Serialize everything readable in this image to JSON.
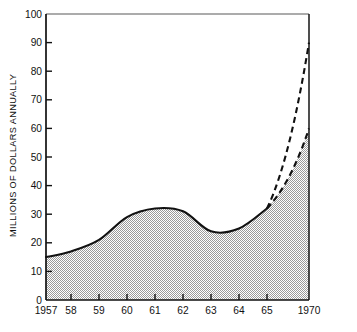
{
  "chart_data": {
    "type": "area",
    "title": "",
    "xlabel": "",
    "ylabel": "MILLIONS OF DOLLARS ANNUALLY",
    "ylim": [
      0,
      100
    ],
    "ytick_values": [
      0,
      10,
      20,
      30,
      40,
      50,
      60,
      70,
      80,
      90,
      100
    ],
    "ytick_labels": [
      "0",
      "10",
      "20",
      "30",
      "40",
      "50",
      "60",
      "70",
      "80",
      "90",
      "100"
    ],
    "categories": [
      "1957",
      "58",
      "59",
      "60",
      "61",
      "62",
      "63",
      "64",
      "65",
      "1970"
    ],
    "xtick_labels": [
      "1957",
      "58",
      "59",
      "60",
      "61",
      "62",
      "63",
      "64",
      "65",
      "1970"
    ],
    "grid": false,
    "legend": "none",
    "series": [
      {
        "name": "Actual",
        "style": "solid",
        "filled": true,
        "x": [
          "1957",
          "58",
          "59",
          "60",
          "61",
          "62",
          "63",
          "64",
          "65"
        ],
        "values": [
          15,
          17,
          21,
          29,
          32,
          31,
          24,
          25,
          32
        ]
      },
      {
        "name": "High projection",
        "style": "dashed",
        "filled": false,
        "x": [
          "65",
          "1970"
        ],
        "values": [
          32,
          90
        ]
      },
      {
        "name": "Low projection",
        "style": "dashed",
        "filled": true,
        "x": [
          "65",
          "1970"
        ],
        "values": [
          32,
          60
        ]
      }
    ]
  },
  "colors": {
    "axis": "#111111",
    "frame_top": "#8a8a8a",
    "line": "#111111",
    "fill": "#b8b8b8",
    "background": "#ffffff"
  }
}
